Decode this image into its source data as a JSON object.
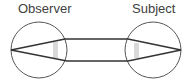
{
  "labels": {
    "observer": "Observer",
    "subject": "Subject"
  },
  "diagram": {
    "eyes": [
      {
        "name": "observer",
        "cx": 39,
        "cy": 50,
        "r": 28,
        "apex": [
          11,
          50
        ],
        "lens": {
          "x": 53,
          "y": 42,
          "w": 5,
          "h": 16
        }
      },
      {
        "name": "subject",
        "cx": 153,
        "cy": 50,
        "r": 28,
        "apex": [
          181,
          50
        ],
        "lens": {
          "x": 134,
          "y": 43,
          "w": 5,
          "h": 15
        }
      }
    ],
    "colors": {
      "circle_stroke": "#555555",
      "line_stroke": "#333333",
      "lens_fill": "#d9d9d9",
      "label_text": "#404040"
    }
  }
}
